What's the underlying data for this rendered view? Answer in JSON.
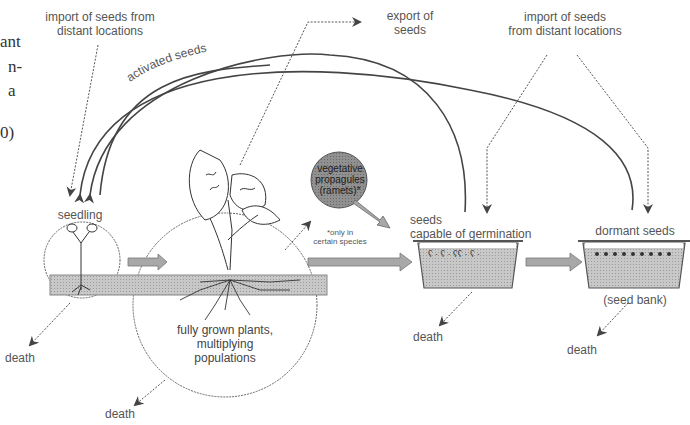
{
  "margin_text": {
    "lines": [
      "ant",
      "n-",
      "a",
      "",
      "0)"
    ]
  },
  "labels": {
    "import_left": [
      "import of seeds from",
      "distant locations"
    ],
    "export": [
      "export of",
      "seeds"
    ],
    "import_right": [
      "import of seeds",
      "from distant locations"
    ],
    "activated_seeds": "activated seeds",
    "seedling": "seedling",
    "fully_grown": [
      "fully grown plants,",
      "multiplying",
      "populations"
    ],
    "vegetative": [
      "vegetative",
      "propagules",
      "(ramets)*"
    ],
    "footnote": [
      "*only in",
      "certain species"
    ],
    "seeds_capable": [
      "seeds",
      "capable of germination"
    ],
    "dormant_seeds": "dormant seeds",
    "seed_bank": "(seed bank)",
    "death_seedling": "death",
    "death_plants": "death",
    "death_germination": "death",
    "death_dormant": "death"
  },
  "colors": {
    "line": "#444444",
    "band": "#bdbdbd",
    "arrow_fill": "#a8a8a8",
    "vegetative_fill": "#8e8e8e",
    "soil": "#c4c4c4"
  }
}
